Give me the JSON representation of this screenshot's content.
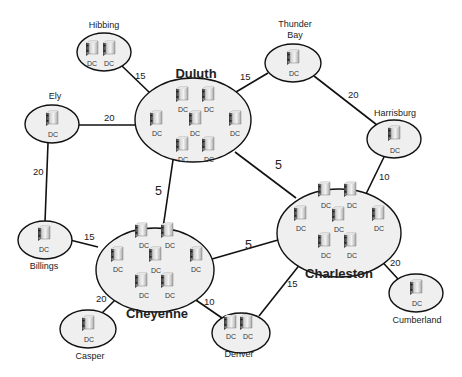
{
  "diagram": {
    "server_label": "DC",
    "server_icon": "server-tower-icon",
    "sites": [
      {
        "id": "hibbing",
        "name": "Hibbing",
        "dc_count": 2,
        "hub": false
      },
      {
        "id": "duluth",
        "name": "Duluth",
        "dc_count": 7,
        "hub": true
      },
      {
        "id": "ely",
        "name": "Ely",
        "dc_count": 1,
        "hub": false
      },
      {
        "id": "thunder_bay",
        "name": "Thunder Bay",
        "name_lines": [
          "Thunder",
          "Bay"
        ],
        "dc_count": 1,
        "hub": false
      },
      {
        "id": "harrisburg",
        "name": "Harrisburg",
        "dc_count": 1,
        "hub": false
      },
      {
        "id": "charleston",
        "name": "Charleston",
        "dc_count": 7,
        "hub": true
      },
      {
        "id": "billings",
        "name": "Billings",
        "dc_count": 1,
        "hub": false
      },
      {
        "id": "cheyenne",
        "name": "Cheyenne",
        "dc_count": 7,
        "hub": true
      },
      {
        "id": "casper",
        "name": "Casper",
        "dc_count": 1,
        "hub": false
      },
      {
        "id": "denver",
        "name": "Denver",
        "dc_count": 2,
        "hub": false
      },
      {
        "id": "cumberland",
        "name": "Cumberland",
        "dc_count": 1,
        "hub": false
      }
    ],
    "links": [
      {
        "from": "Hibbing",
        "to": "Duluth",
        "cost": "15"
      },
      {
        "from": "Ely",
        "to": "Duluth",
        "cost": "20"
      },
      {
        "from": "Duluth",
        "to": "Thunder Bay",
        "cost": "15"
      },
      {
        "from": "Thunder Bay",
        "to": "Harrisburg",
        "cost": "20"
      },
      {
        "from": "Ely",
        "to": "Billings",
        "cost": "20"
      },
      {
        "from": "Duluth",
        "to": "Cheyenne",
        "cost": "5"
      },
      {
        "from": "Duluth",
        "to": "Charleston",
        "cost": "5"
      },
      {
        "from": "Harrisburg",
        "to": "Charleston",
        "cost": "10"
      },
      {
        "from": "Billings",
        "to": "Cheyenne",
        "cost": "15"
      },
      {
        "from": "Cheyenne",
        "to": "Charleston",
        "cost": "5"
      },
      {
        "from": "Cheyenne",
        "to": "Casper",
        "cost": "20"
      },
      {
        "from": "Cheyenne",
        "to": "Denver",
        "cost": "10"
      },
      {
        "from": "Charleston",
        "to": "Denver",
        "cost": "15"
      },
      {
        "from": "Charleston",
        "to": "Cumberland",
        "cost": "20"
      }
    ]
  }
}
